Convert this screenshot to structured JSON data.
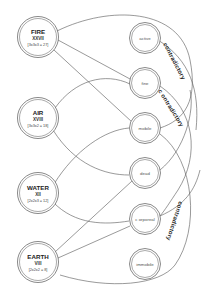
{
  "elements": [
    {
      "name": "FIRE",
      "numeral": "XXVII",
      "formula": "[3x3x3 = 27]"
    },
    {
      "name": "AIR",
      "numeral": "XVIII",
      "formula": "[3x3x2 = 18]"
    },
    {
      "name": "WATER",
      "numeral": "XII",
      "formula": "[2x2x3 = 12]"
    },
    {
      "name": "EARTH",
      "numeral": "VIII",
      "formula": "[2x2x2 = 8]"
    }
  ],
  "qualities": [
    {
      "label": "active"
    },
    {
      "label": "fine"
    },
    {
      "label": "mobile"
    },
    {
      "label": "dead"
    },
    {
      "label": "c orporeal"
    },
    {
      "label": "immobile"
    }
  ],
  "arc_labels": [
    {
      "text": "contradictory"
    },
    {
      "text": "c ontradictory"
    },
    {
      "text": "contradictory"
    }
  ],
  "connections": [
    {
      "from": "FIRE",
      "to": "active"
    },
    {
      "from": "FIRE",
      "to": "fine"
    },
    {
      "from": "FIRE",
      "to": "mobile"
    },
    {
      "from": "AIR",
      "to": "fine"
    },
    {
      "from": "AIR",
      "to": "dead"
    },
    {
      "from": "WATER",
      "to": "mobile"
    },
    {
      "from": "WATER",
      "to": "c orporeal"
    },
    {
      "from": "EARTH",
      "to": "dead"
    },
    {
      "from": "EARTH",
      "to": "c orporeal"
    },
    {
      "from": "EARTH",
      "to": "immobile"
    }
  ],
  "colors": {
    "stroke": "#555555",
    "text": "#222222",
    "background": "#ffffff"
  }
}
